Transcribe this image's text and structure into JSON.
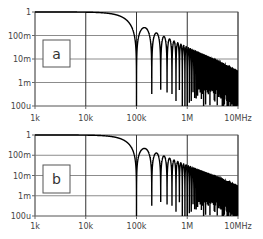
{
  "chart_data": [
    {
      "type": "line",
      "panel_label": "a",
      "title": "",
      "xlabel": "",
      "ylabel": "",
      "xscale": "log",
      "yscale": "log",
      "xlim": [
        1000,
        10000000
      ],
      "ylim": [
        0.0001,
        1
      ],
      "x_tick_labels": [
        "1k",
        "10k",
        "100k",
        "1M",
        "10MHz"
      ],
      "x_tick_values": [
        1000,
        10000,
        100000,
        1000000,
        10000000
      ],
      "y_tick_labels": [
        "1",
        "100m",
        "10m",
        "1m",
        "100u"
      ],
      "y_tick_values": [
        1,
        0.1,
        0.01,
        0.001,
        0.0001
      ],
      "grid": true,
      "series": [
        {
          "name": "magnitude",
          "function": "|sinc(f/f0)|",
          "f0": 100000,
          "x": [
            1000,
            10000,
            50000,
            80000,
            100000,
            150000,
            200000,
            250000,
            300000,
            1000000,
            10000000
          ],
          "values": [
            1.0,
            0.998,
            0.637,
            0.234,
            0.0,
            0.212,
            0.0,
            0.127,
            0.0,
            0.032,
            0.0032
          ]
        }
      ],
      "color": "#000000"
    },
    {
      "type": "line",
      "panel_label": "b",
      "title": "",
      "xlabel": "",
      "ylabel": "",
      "xscale": "log",
      "yscale": "log",
      "xlim": [
        1000,
        10000000
      ],
      "ylim": [
        0.0001,
        1
      ],
      "x_tick_labels": [
        "1k",
        "10k",
        "100k",
        "1M",
        "10MHz"
      ],
      "x_tick_values": [
        1000,
        10000,
        100000,
        1000000,
        10000000
      ],
      "y_tick_labels": [
        "1",
        "100m",
        "10m",
        "1m",
        "100u"
      ],
      "y_tick_values": [
        1,
        0.1,
        0.01,
        0.001,
        0.0001
      ],
      "grid": true,
      "series": [
        {
          "name": "magnitude",
          "function": "|sinc(f/f0)|",
          "f0": 100000,
          "x": [
            1000,
            10000,
            50000,
            80000,
            100000,
            150000,
            200000,
            250000,
            300000,
            1000000,
            10000000
          ],
          "values": [
            1.0,
            0.998,
            0.637,
            0.234,
            0.0,
            0.212,
            0.0,
            0.127,
            0.0,
            0.032,
            0.0032
          ]
        }
      ],
      "color": "#000000"
    }
  ],
  "panels": [
    {
      "label": "a",
      "box": {
        "x": 35,
        "y": 12,
        "w": 203,
        "h": 94
      },
      "tag": {
        "x": 43,
        "y": 40,
        "w": 27,
        "h": 27
      },
      "xlabel_y": 121
    },
    {
      "label": "b",
      "box": {
        "x": 35,
        "y": 135,
        "w": 203,
        "h": 81
      },
      "tag": {
        "x": 43,
        "y": 165,
        "w": 27,
        "h": 28
      },
      "xlabel_y": 229
    }
  ],
  "colors": {
    "grid": "#8c8c8c",
    "axis": "#666666",
    "trace": "#000000",
    "text": "#444444"
  }
}
